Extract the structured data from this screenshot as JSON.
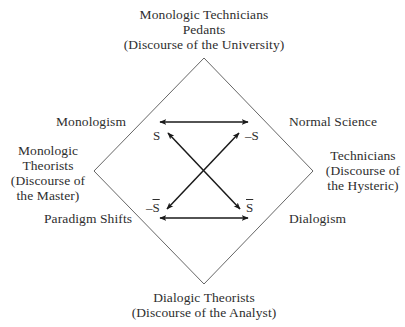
{
  "diagram": {
    "type": "semiotic-square",
    "line_color": "#555555",
    "arrow_color": "#1a1a1a",
    "text_color": "#2e2e2e",
    "top": {
      "lines": [
        "Monologic Technicians",
        "Pedants",
        "(Discourse of the University)"
      ]
    },
    "left": {
      "lines": [
        "Monologic",
        "Theorists",
        "(Discourse of",
        "the Master)"
      ]
    },
    "right": {
      "lines": [
        "Technicians",
        "(Discourse of",
        "the Hysteric)"
      ]
    },
    "bottom": {
      "lines": [
        "Dialogic Theorists",
        "(Discourse of the Analyst)"
      ]
    },
    "corners": {
      "top_left": "Monologism",
      "top_right": "Normal Science",
      "bottom_left": "Paradigm Shifts",
      "bottom_right": "Dialogism"
    },
    "symbols": {
      "s": "S",
      "neg_s": "–S",
      "neg_s_bar_prefix": "–",
      "neg_s_bar_letter": "S",
      "s_bar_letter": "S"
    }
  }
}
